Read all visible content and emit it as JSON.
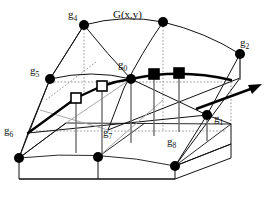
{
  "figure": {
    "title": "G(x,y)",
    "surface_label": "G(x,y)",
    "colors": {
      "stroke": "#111111",
      "marker_fill": "#000000",
      "marker_open_fill": "#ffffff",
      "guide": "#7a7a7a",
      "background": "#ffffff"
    },
    "nodes": [
      {
        "id": "g0",
        "label": "g",
        "sub": "0",
        "x": 131,
        "y": 79,
        "marker": "filled-circle",
        "label_x": 120,
        "label_y": 66
      },
      {
        "id": "g1",
        "label": "g",
        "sub": "1",
        "x": 207,
        "y": 115,
        "marker": "filled-circle",
        "label_x": 215,
        "label_y": 121
      },
      {
        "id": "g2",
        "label": "g",
        "sub": "2",
        "x": 240,
        "y": 54,
        "marker": "filled-circle",
        "label_x": 243,
        "label_y": 46
      },
      {
        "id": "g3",
        "label": "g",
        "sub": "3",
        "x": 163,
        "y": 22,
        "marker": "filled-circle",
        "label_x": 163,
        "label_y": 22
      },
      {
        "id": "g4",
        "label": "g",
        "sub": "4",
        "x": 84,
        "y": 25,
        "marker": "filled-circle",
        "label_x": 73,
        "label_y": 16
      },
      {
        "id": "g5",
        "label": "g",
        "sub": "5",
        "x": 50,
        "y": 79,
        "marker": "filled-circle",
        "label_x": 32,
        "label_y": 72
      },
      {
        "id": "g6",
        "label": "g",
        "sub": "6",
        "x": 28,
        "y": 133,
        "marker": "none",
        "label_x": 6,
        "label_y": 131
      },
      {
        "id": "g7",
        "label": "g",
        "sub": "7",
        "x": 108,
        "y": 130,
        "marker": "none",
        "label_x": 104,
        "label_y": 133
      },
      {
        "id": "g8",
        "label": "g",
        "sub": "8",
        "x": 175,
        "y": 138,
        "marker": "none",
        "label_x": 168,
        "label_y": 141
      }
    ],
    "base_nodes": [
      {
        "id": "base-left",
        "x": 19,
        "y": 158
      },
      {
        "id": "base-mid",
        "x": 98,
        "y": 157
      },
      {
        "id": "base-right",
        "x": 175,
        "y": 166
      }
    ],
    "square_markers": [
      {
        "id": "sq-open-1",
        "type": "open",
        "x": 76,
        "y": 98
      },
      {
        "id": "sq-open-2",
        "type": "open",
        "x": 102,
        "y": 86
      },
      {
        "id": "sq-filled-1",
        "type": "filled",
        "x": 154,
        "y": 74
      },
      {
        "id": "sq-filled-2",
        "type": "filled",
        "x": 179,
        "y": 73
      }
    ],
    "arrow": {
      "id": "direction-arrow",
      "x1": 196,
      "y1": 109,
      "x2": 262,
      "y2": 85
    }
  }
}
